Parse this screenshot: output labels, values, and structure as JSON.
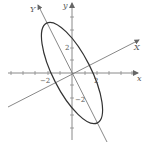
{
  "diagram": {
    "colors": {
      "axis": "#8a8a8a",
      "rotated_axis": "#7a7a7a",
      "ellipse": "#333333",
      "text": "#555555"
    },
    "axes": {
      "x_label": "x",
      "y_label": "y",
      "X_label": "X",
      "Y_label": "Y",
      "x_tick_labels": {
        "neg": "−2",
        "pos": "2"
      },
      "y_tick_labels": {
        "neg": "−2",
        "pos": "2"
      },
      "x_range": [
        -5,
        5
      ],
      "y_range": [
        -5,
        5
      ],
      "rotation_angle_deg": 27
    },
    "ellipse": {
      "center": [
        0,
        0
      ],
      "semi_axis_X": 1.5,
      "semi_axis_Y": 4.5
    }
  }
}
